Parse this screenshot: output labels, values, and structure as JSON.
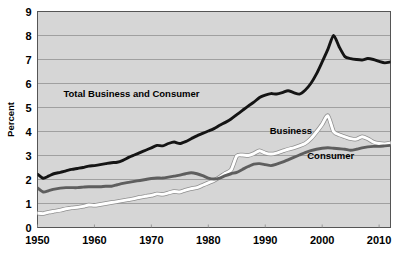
{
  "chart_data": {
    "type": "line",
    "title": "",
    "subtitle": "",
    "xlabel": "",
    "ylabel": "Percent",
    "xlim": [
      1950,
      2012
    ],
    "ylim": [
      0,
      9
    ],
    "ytick_values": [
      0,
      1,
      2,
      3,
      4,
      5,
      6,
      7,
      8,
      9
    ],
    "ytick_labels": [
      "0",
      "1",
      "2",
      "3",
      "4",
      "5",
      "6",
      "7",
      "8",
      "9"
    ],
    "xtick_values": [
      1950,
      1960,
      1970,
      1980,
      1990,
      2000,
      2010
    ],
    "xtick_labels": [
      "1950",
      "1960",
      "1970",
      "1980",
      "1990",
      "2000",
      "2010"
    ],
    "grid": "horizontal",
    "legend_position": "inline-annotations",
    "plot_background": "#d6d6d6",
    "gridline_color": "#9a9a9a",
    "frame_color": "#555555",
    "x": [
      1950,
      1951,
      1952,
      1953,
      1954,
      1955,
      1956,
      1957,
      1958,
      1959,
      1960,
      1961,
      1962,
      1963,
      1964,
      1965,
      1966,
      1967,
      1968,
      1969,
      1970,
      1971,
      1972,
      1973,
      1974,
      1975,
      1976,
      1977,
      1978,
      1979,
      1980,
      1981,
      1982,
      1983,
      1984,
      1985,
      1986,
      1987,
      1988,
      1989,
      1990,
      1991,
      1992,
      1993,
      1994,
      1995,
      1996,
      1997,
      1998,
      1999,
      2000,
      2001,
      2002,
      2003,
      2004,
      2005,
      2006,
      2007,
      2008,
      2009,
      2010,
      2011,
      2012
    ],
    "series": [
      {
        "name": "Total Business and Consumer",
        "color": "#141414",
        "label_text": "Total Business and Consumer",
        "label_x": 1966.5,
        "label_y": 5.45,
        "values": [
          2.22,
          2.05,
          2.15,
          2.25,
          2.3,
          2.36,
          2.42,
          2.46,
          2.5,
          2.56,
          2.58,
          2.62,
          2.66,
          2.7,
          2.72,
          2.8,
          2.92,
          3.02,
          3.12,
          3.22,
          3.32,
          3.42,
          3.4,
          3.5,
          3.56,
          3.5,
          3.58,
          3.7,
          3.82,
          3.92,
          4.02,
          4.12,
          4.26,
          4.38,
          4.52,
          4.7,
          4.88,
          5.06,
          5.22,
          5.42,
          5.52,
          5.58,
          5.56,
          5.62,
          5.7,
          5.62,
          5.56,
          5.72,
          6.0,
          6.4,
          6.9,
          7.42,
          8.0,
          7.52,
          7.12,
          7.04,
          7.0,
          6.98,
          7.04,
          7.0,
          6.92,
          6.86,
          6.9
        ]
      },
      {
        "name": "Business",
        "color": "#ffffff",
        "label_text": "Business",
        "label_x": 1994.5,
        "label_y": 3.9,
        "values": [
          0.6,
          0.58,
          0.64,
          0.68,
          0.72,
          0.78,
          0.82,
          0.84,
          0.88,
          0.94,
          0.92,
          0.96,
          1.0,
          1.04,
          1.08,
          1.12,
          1.16,
          1.2,
          1.26,
          1.3,
          1.34,
          1.4,
          1.38,
          1.44,
          1.5,
          1.48,
          1.56,
          1.62,
          1.66,
          1.76,
          1.86,
          1.96,
          2.1,
          2.26,
          2.4,
          2.98,
          3.02,
          3.0,
          3.08,
          3.2,
          3.1,
          3.06,
          3.1,
          3.18,
          3.26,
          3.32,
          3.4,
          3.5,
          3.7,
          3.98,
          4.3,
          4.66,
          4.0,
          3.86,
          3.78,
          3.7,
          3.68,
          3.78,
          3.7,
          3.56,
          3.5,
          3.48,
          3.52
        ]
      },
      {
        "name": "Consumer",
        "color": "#5e5e5e",
        "label_text": "Consumer",
        "label_x": 2001.5,
        "label_y": 2.85,
        "values": [
          1.65,
          1.48,
          1.54,
          1.6,
          1.64,
          1.66,
          1.66,
          1.66,
          1.68,
          1.7,
          1.7,
          1.7,
          1.72,
          1.72,
          1.78,
          1.84,
          1.88,
          1.92,
          1.96,
          2.0,
          2.04,
          2.06,
          2.06,
          2.1,
          2.14,
          2.18,
          2.24,
          2.28,
          2.24,
          2.16,
          2.06,
          2.02,
          2.06,
          2.16,
          2.24,
          2.3,
          2.42,
          2.54,
          2.64,
          2.66,
          2.62,
          2.58,
          2.64,
          2.72,
          2.82,
          2.92,
          3.02,
          3.12,
          3.2,
          3.26,
          3.3,
          3.32,
          3.3,
          3.28,
          3.26,
          3.22,
          3.26,
          3.32,
          3.36,
          3.38,
          3.38,
          3.4,
          3.42
        ]
      }
    ]
  }
}
